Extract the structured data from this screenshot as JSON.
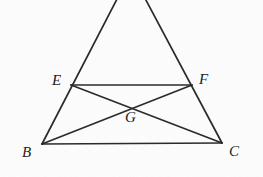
{
  "figure": {
    "kind": "geometry-diagram",
    "background_color": "#fdfdfd",
    "stroke_color": "#2b2b2b",
    "label_color": "#1d1d1d",
    "canvas": {
      "width": 263,
      "height": 177
    },
    "points": [
      {
        "id": "A",
        "label": "",
        "x": 131,
        "y": -28,
        "label_x": 0,
        "label_y": 0,
        "visible_label": false
      },
      {
        "id": "E",
        "label": "E",
        "x": 71,
        "y": 85,
        "label_x": 52,
        "label_y": 73,
        "visible_label": true
      },
      {
        "id": "F",
        "label": "F",
        "x": 192,
        "y": 85,
        "label_x": 199,
        "label_y": 72,
        "visible_label": true
      },
      {
        "id": "G",
        "label": "G",
        "x": 132,
        "y": 105,
        "label_x": 125,
        "label_y": 110,
        "visible_label": true
      },
      {
        "id": "B",
        "label": "B",
        "x": 42,
        "y": 144,
        "label_x": 22,
        "label_y": 145,
        "visible_label": true
      },
      {
        "id": "C",
        "label": "C",
        "x": 222,
        "y": 143,
        "label_x": 229,
        "label_y": 144,
        "visible_label": true
      }
    ],
    "segments": [
      {
        "id": "AB",
        "from": "A",
        "to": "B",
        "name": "left-side-AB"
      },
      {
        "id": "AC",
        "from": "A",
        "to": "C",
        "name": "right-side-AC"
      },
      {
        "id": "EF",
        "from": "E",
        "to": "F",
        "name": "midsegment-EF"
      },
      {
        "id": "BC",
        "from": "B",
        "to": "C",
        "name": "base-BC"
      },
      {
        "id": "EC",
        "from": "E",
        "to": "C",
        "name": "diagonal-EC"
      },
      {
        "id": "BF",
        "from": "B",
        "to": "F",
        "name": "diagonal-BF"
      }
    ]
  }
}
